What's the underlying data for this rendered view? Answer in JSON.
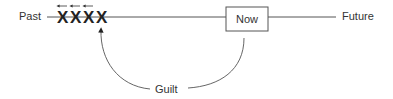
{
  "diagram": {
    "timeline": {
      "start_label": "Past",
      "end_label": "Future",
      "now_label": "Now"
    },
    "marks": [
      "X",
      "X",
      "X",
      "X"
    ],
    "back_arrows": 3,
    "loop_label": "Guilt",
    "colors": {
      "line": "#555555",
      "text": "#333333",
      "marks": "#222222"
    }
  }
}
